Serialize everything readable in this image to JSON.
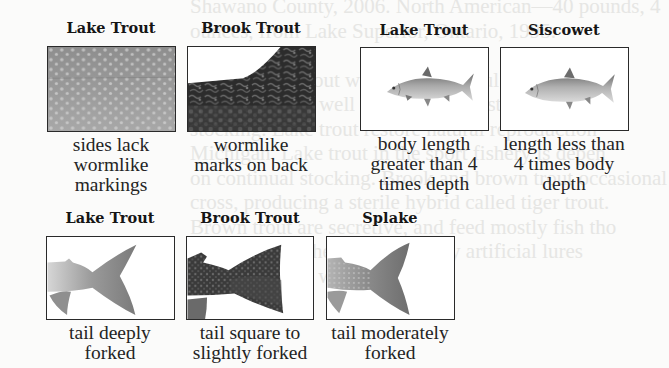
{
  "background_text": {
    "note": "faint bleed-through from reverse side of page",
    "lines": [
      "Shawano County, 2006. North American—40 pounds, 4",
      "ounces, from Lake Superior, Ontario, 1995.",
      "",
      "ntered. Lake trout was once plentiful in America",
      "1950s and was well established. Restoration from l",
      "stocking. Lake trout restore natural reproduction",
      "Michigan. Lake trout in the sport fishery is depen",
      "on continual stocking. Brook and brown trout occasional",
      "cross, producing a sterile hybrid called tiger trout.",
      "Brown trout are secretive, and feed mostly fish tho",
      "feed at night; they are caught by artificial lures",
      "throughout the w"
    ]
  },
  "panels": [
    {
      "id": "lake-trout-sides",
      "title": "Lake Trout",
      "caption_lines": [
        "sides lack",
        "wormlike",
        "markings"
      ],
      "image": "spotted-side-pattern"
    },
    {
      "id": "brook-trout-back",
      "title": "Brook Trout",
      "caption_lines": [
        "wormlike",
        "marks on back"
      ],
      "image": "vermiculated-back-pattern"
    },
    {
      "id": "lake-trout-body",
      "title": "Lake Trout",
      "caption_lines": [
        "body length",
        "greater than 4",
        "times depth"
      ],
      "image": "slender-fish-profile"
    },
    {
      "id": "siscowet-body",
      "title": "Siscowet",
      "caption_lines": [
        "length less than",
        "4 times body",
        "depth"
      ],
      "image": "deep-fish-profile"
    },
    {
      "id": "lake-trout-tail",
      "title": "Lake Trout",
      "caption_lines": [
        "tail deeply",
        "forked"
      ],
      "image": "deeply-forked-tail"
    },
    {
      "id": "brook-trout-tail",
      "title": "Brook Trout",
      "caption_lines": [
        "tail square to",
        "slightly forked"
      ],
      "image": "square-tail"
    },
    {
      "id": "splake-tail",
      "title": "Splake",
      "caption_lines": [
        "tail moderately",
        "forked"
      ],
      "image": "moderately-forked-tail"
    }
  ],
  "colors": {
    "frame_border": "#2a2a2a",
    "title_text": "#151515",
    "caption_text": "#242424",
    "page_bg": "#fbfbfa",
    "ghost_text": "#e6e6e4"
  }
}
